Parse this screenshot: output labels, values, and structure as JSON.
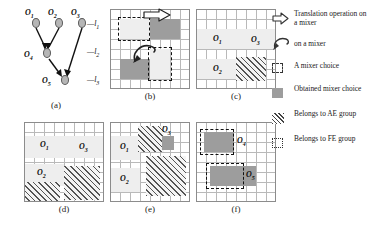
{
  "figure": {
    "panels": [
      {
        "id": "a",
        "caption": "(a)"
      },
      {
        "id": "b",
        "caption": "(b)"
      },
      {
        "id": "c",
        "caption": "(c)"
      },
      {
        "id": "d",
        "caption": "(d)"
      },
      {
        "id": "e",
        "caption": "(e)"
      },
      {
        "id": "f",
        "caption": "(f)"
      }
    ]
  },
  "panel_a": {
    "nodes": [
      {
        "name": "O1",
        "label": "O",
        "sub": "1"
      },
      {
        "name": "O2",
        "label": "O",
        "sub": "2"
      },
      {
        "name": "O3",
        "label": "O",
        "sub": "3"
      },
      {
        "name": "O4",
        "label": "O",
        "sub": "4"
      },
      {
        "name": "O5",
        "label": "O",
        "sub": "5"
      }
    ],
    "levels": [
      {
        "name": "l1",
        "label": "l",
        "sub": "1"
      },
      {
        "name": "l2",
        "label": "l",
        "sub": "2"
      },
      {
        "name": "l3",
        "label": "l",
        "sub": "3"
      }
    ],
    "dashes": [
      "—",
      "—",
      "—"
    ]
  },
  "panel_c": {
    "labels": [
      {
        "label": "O",
        "sub": "1"
      },
      {
        "label": "O",
        "sub": "3"
      },
      {
        "label": "O",
        "sub": "2"
      }
    ]
  },
  "panel_d": {
    "labels": [
      {
        "label": "O",
        "sub": "1"
      },
      {
        "label": "O",
        "sub": "3"
      },
      {
        "label": "O",
        "sub": "2"
      }
    ]
  },
  "panel_e": {
    "labels": [
      {
        "label": "O",
        "sub": "1"
      },
      {
        "label": "O",
        "sub": "3"
      },
      {
        "label": "O",
        "sub": "2"
      }
    ]
  },
  "panel_f": {
    "labels": [
      {
        "label": "O",
        "sub": "4"
      },
      {
        "label": "O",
        "sub": "5"
      }
    ]
  },
  "legend": {
    "items": [
      {
        "icon": "right-arrow-outline-icon",
        "text": "Translation operation on a mixer"
      },
      {
        "icon": "curved-arrow-icon",
        "text": "on a mixer"
      },
      {
        "icon": "dashed-square-icon",
        "text": "A mixer choice"
      },
      {
        "icon": "gray-square-icon",
        "text": "Obtained mixer choice"
      },
      {
        "icon": "hatched-square-icon",
        "text": "Belongs to AE group"
      },
      {
        "icon": "dotted-square-icon",
        "text": "Belongs to FE group"
      }
    ]
  },
  "colors": {
    "grid_line": "#b9b9b9",
    "grid_border": "#8c8c8c",
    "block_light": "#eeeeee",
    "block_dark": "#9d9d9d",
    "hatch": "#555555",
    "node_fill": "#b6b6b6"
  }
}
